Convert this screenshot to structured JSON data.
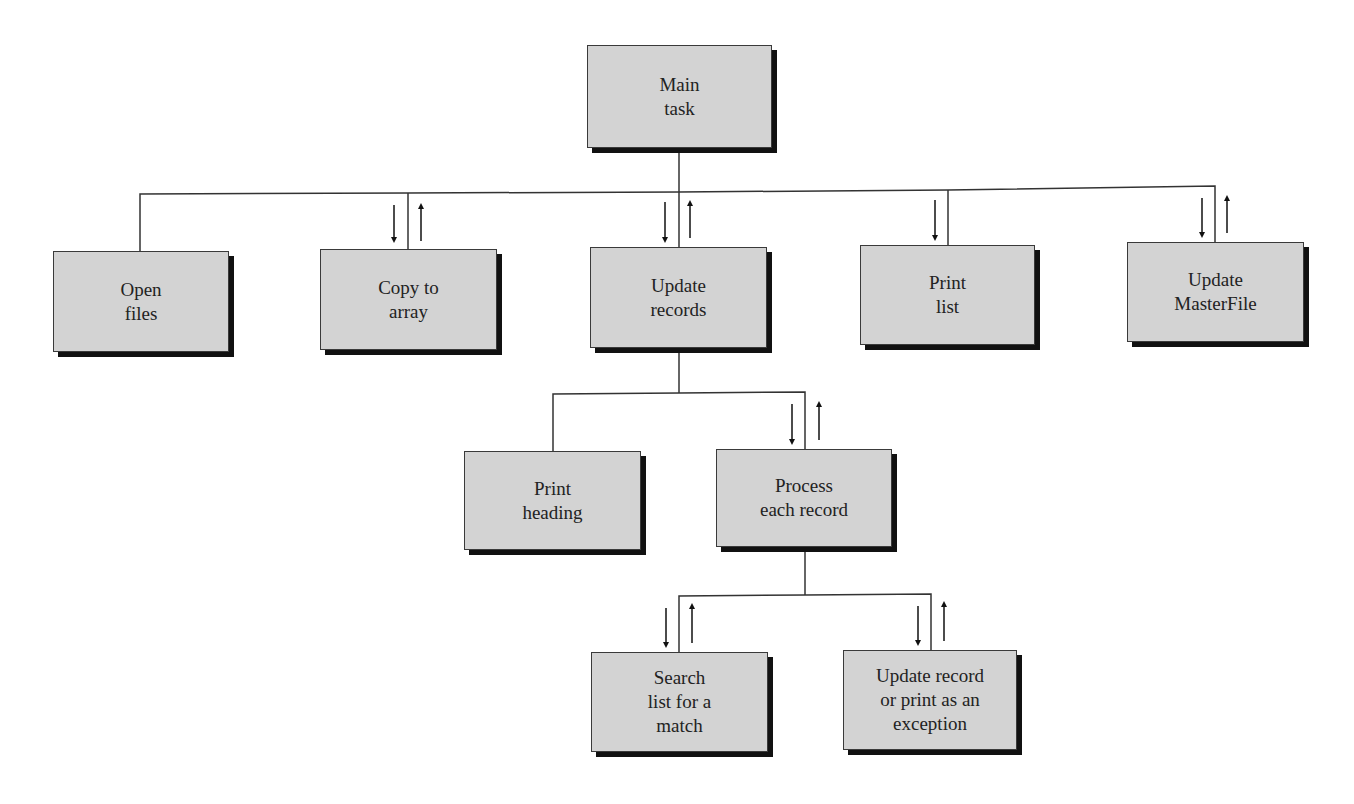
{
  "diagram": {
    "type": "structure-chart",
    "colors": {
      "box_fill": "#d3d3d3",
      "box_border": "#3a3a3a",
      "shadow": "#111111",
      "line": "#333333"
    },
    "nodes": {
      "main": {
        "label": "Main\ntask"
      },
      "open": {
        "label": "Open\nfiles"
      },
      "copy": {
        "label": "Copy to\narray"
      },
      "update": {
        "label": "Update\nrecords"
      },
      "print": {
        "label": "Print\nlist"
      },
      "master": {
        "label": "Update\nMasterFile"
      },
      "heading": {
        "label": "Print\nheading"
      },
      "process": {
        "label": "Process\neach record"
      },
      "search": {
        "label": "Search\nlist for a\nmatch"
      },
      "updrec": {
        "label": "Update record\nor print as an\nexception"
      }
    },
    "edges": [
      {
        "from": "main",
        "to": "open",
        "data_flow": "none"
      },
      {
        "from": "main",
        "to": "copy",
        "data_flow": "in-out"
      },
      {
        "from": "main",
        "to": "update",
        "data_flow": "in-out"
      },
      {
        "from": "main",
        "to": "print",
        "data_flow": "in"
      },
      {
        "from": "main",
        "to": "master",
        "data_flow": "in-out"
      },
      {
        "from": "update",
        "to": "heading",
        "data_flow": "none"
      },
      {
        "from": "update",
        "to": "process",
        "data_flow": "in-out"
      },
      {
        "from": "process",
        "to": "search",
        "data_flow": "in-out"
      },
      {
        "from": "process",
        "to": "updrec",
        "data_flow": "in-out"
      }
    ]
  }
}
